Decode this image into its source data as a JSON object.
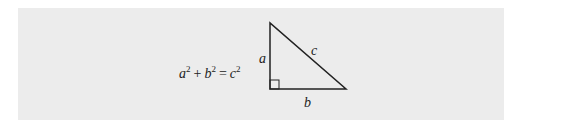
{
  "figure": {
    "equation": {
      "a": "a",
      "a_exp": "2",
      "plus": "+",
      "b": "b",
      "b_exp": "2",
      "equals": "=",
      "c": "c",
      "c_exp": "2"
    },
    "triangle": {
      "labels": {
        "vertical_leg": "a",
        "horizontal_leg": "b",
        "hypotenuse": "c"
      },
      "right_angle_marker": true,
      "stroke_color": "#222222"
    },
    "panel_color": "#ececec"
  }
}
